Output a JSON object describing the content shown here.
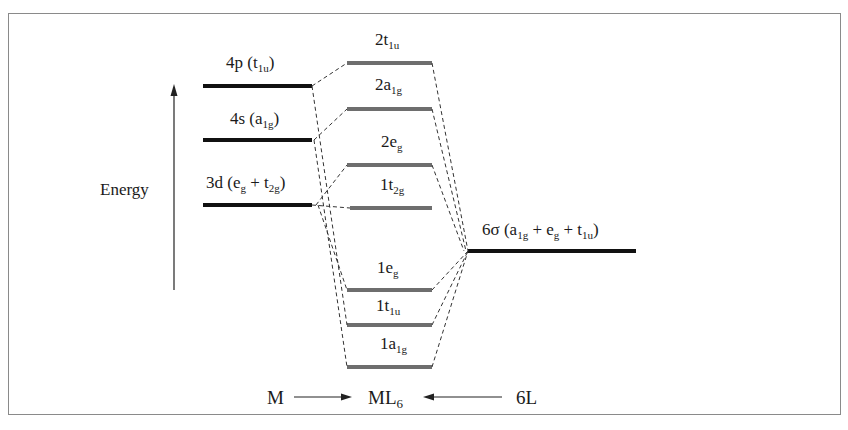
{
  "diagram": {
    "energy_axis": {
      "label": "Energy",
      "x": 174,
      "y_top": 86,
      "y_bottom": 290
    },
    "metal_levels": [
      {
        "id": "4p",
        "label": "4p (t",
        "sub": "1u",
        "after": ")",
        "y": 86
      },
      {
        "id": "4s",
        "label": "4s (a",
        "sub": "1g",
        "after": ")",
        "y": 140
      },
      {
        "id": "3d",
        "label": "3d (e",
        "sub": "g",
        "mid": " + t",
        "sub2": "2g",
        "after": ")",
        "y": 205
      }
    ],
    "mo_levels": [
      {
        "id": "2t1u",
        "label": "2t",
        "sub": "1u",
        "y": 63
      },
      {
        "id": "2a1g",
        "label": "2a",
        "sub": "1g",
        "y": 109
      },
      {
        "id": "2eg",
        "label": "2e",
        "sub": "g",
        "y": 165
      },
      {
        "id": "1t2g",
        "label": "1t",
        "sub": "2g",
        "y": 208
      },
      {
        "id": "1eg",
        "label": "1e",
        "sub": "g",
        "y": 290
      },
      {
        "id": "1t1u",
        "label": "1t",
        "sub": "1u",
        "y": 325
      },
      {
        "id": "1a1g",
        "label": "1a",
        "sub": "1g",
        "y": 367
      }
    ],
    "ligand_level": {
      "label": "6σ (a",
      "sub": "1g",
      "mid": " + e",
      "sub2": "g",
      "mid2": " + t",
      "sub3": "1u",
      "after": ")",
      "y": 251
    },
    "footer": {
      "metal": "M",
      "complex": "ML",
      "complex_sub": "6",
      "ligand": "6L"
    },
    "colors": {
      "metal_line": "#111111",
      "mo_line": "#6e6e6e",
      "ligand_line": "#111111",
      "dash": "#333333",
      "frame": "#8a8a8a"
    }
  }
}
